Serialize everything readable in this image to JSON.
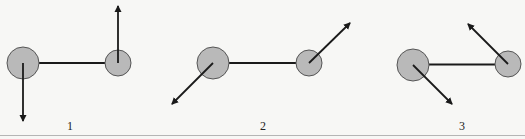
{
  "figure": {
    "colors": {
      "background": "#f7f7f5",
      "circle_fill": "#b9b9b9",
      "circle_stroke": "#555555",
      "line": "#1a1a1a",
      "rule": "#b5b5b5"
    },
    "panels": [
      {
        "label": "1",
        "label_x": 70,
        "large_atom": {
          "cx": 23,
          "cy": 63,
          "r": 16
        },
        "small_atom": {
          "cx": 118,
          "cy": 63,
          "r": 13
        },
        "large_arrow": {
          "x2": 23,
          "y2": 121,
          "direction": "down"
        },
        "small_arrow": {
          "x2": 118,
          "y2": 6,
          "direction": "up"
        }
      },
      {
        "label": "2",
        "label_x": 263,
        "large_atom": {
          "cx": 213,
          "cy": 63,
          "r": 16
        },
        "small_atom": {
          "cx": 309,
          "cy": 63,
          "r": 13
        },
        "large_arrow": {
          "x2": 172,
          "y2": 104,
          "direction": "down-left"
        },
        "small_arrow": {
          "x2": 350,
          "y2": 23,
          "direction": "up-right"
        }
      },
      {
        "label": "3",
        "label_x": 462,
        "large_atom": {
          "cx": 413,
          "cy": 65,
          "r": 16
        },
        "small_atom": {
          "cx": 508,
          "cy": 64,
          "r": 13
        },
        "large_arrow": {
          "x2": 452,
          "y2": 104,
          "direction": "down-right"
        },
        "small_arrow": {
          "x2": 468,
          "y2": 24,
          "direction": "up-left"
        }
      }
    ]
  }
}
